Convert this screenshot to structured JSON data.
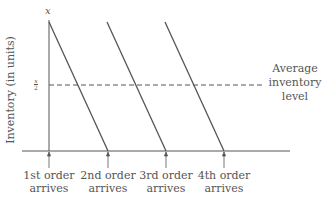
{
  "diagram": {
    "type": "sawtooth inventory model",
    "y_axis": {
      "label": "Inventory (in units)",
      "max_label": "x",
      "mid_label_num": "x",
      "mid_label_den": "2"
    },
    "average_label": {
      "line1": "Average",
      "line2": "inventory",
      "line3": "level"
    },
    "orders": [
      {
        "line1": "1st order",
        "line2": "arrives"
      },
      {
        "line1": "2nd order",
        "line2": "arrives"
      },
      {
        "line1": "3rd order",
        "line2": "arrives"
      },
      {
        "line1": "4th order",
        "line2": "arrives"
      }
    ],
    "colors": {
      "line": "#555555",
      "text": "#555555",
      "background": "#ffffff"
    }
  }
}
